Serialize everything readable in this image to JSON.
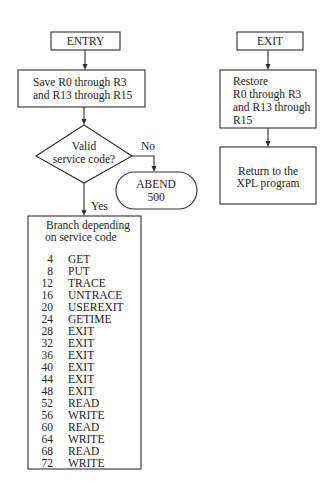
{
  "left_flow": {
    "entry": {
      "label": "ENTRY"
    },
    "save": {
      "lines": [
        "Save R0 through R3",
        "and R13 through R15"
      ]
    },
    "decision": {
      "lines": [
        "Valid",
        "service code?"
      ],
      "no_label": "No",
      "yes_label": "Yes"
    },
    "abend": {
      "lines": [
        "ABEND",
        "500"
      ]
    },
    "branch": {
      "heading": [
        "Branch depending",
        "on service code"
      ],
      "rows": [
        {
          "code": "4",
          "name": "GET"
        },
        {
          "code": "8",
          "name": "PUT"
        },
        {
          "code": "12",
          "name": "TRACE"
        },
        {
          "code": "16",
          "name": "UNTRACE"
        },
        {
          "code": "20",
          "name": "USEREXIT"
        },
        {
          "code": "24",
          "name": "GETIME"
        },
        {
          "code": "28",
          "name": "EXIT"
        },
        {
          "code": "32",
          "name": "EXIT"
        },
        {
          "code": "36",
          "name": "EXIT"
        },
        {
          "code": "40",
          "name": "EXIT"
        },
        {
          "code": "44",
          "name": "EXIT"
        },
        {
          "code": "48",
          "name": "EXIT"
        },
        {
          "code": "52",
          "name": "READ"
        },
        {
          "code": "56",
          "name": "WRITE"
        },
        {
          "code": "60",
          "name": "READ"
        },
        {
          "code": "64",
          "name": "WRITE"
        },
        {
          "code": "68",
          "name": "READ"
        },
        {
          "code": "72",
          "name": "WRITE"
        }
      ]
    }
  },
  "right_flow": {
    "exit": {
      "label": "EXIT"
    },
    "restore": {
      "lines": [
        "Restore",
        "R0 through R3",
        "and R13 through",
        "R15"
      ]
    },
    "return": {
      "lines": [
        "Return to the",
        "XPL program"
      ]
    }
  }
}
